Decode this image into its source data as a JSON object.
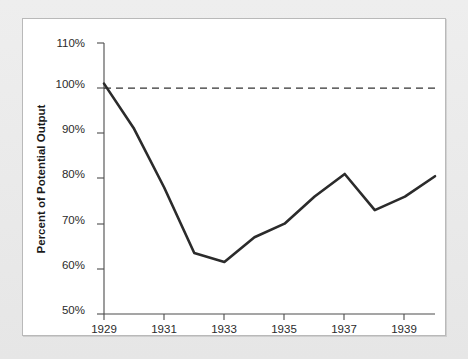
{
  "chart_data": {
    "type": "line",
    "title": "",
    "xlabel": "",
    "ylabel": "Percent of Potential Output",
    "x": [
      1929,
      1930,
      1931,
      1932,
      1933,
      1934,
      1935,
      1936,
      1937,
      1938,
      1939,
      1940
    ],
    "values": [
      101,
      91,
      78,
      63.5,
      61.5,
      67,
      70,
      76,
      81,
      73,
      76,
      80.5
    ],
    "series": [
      {
        "name": "Actual output as percent of potential",
        "values": [
          101,
          91,
          78,
          63.5,
          61.5,
          67,
          70,
          76,
          81,
          73,
          76,
          80.5
        ]
      }
    ],
    "xlim": [
      1929,
      1940
    ],
    "ylim": [
      50,
      110
    ],
    "grid": false,
    "legend": "none",
    "y_ticks": [
      50,
      60,
      70,
      80,
      90,
      100,
      110
    ],
    "y_tick_labels": [
      "50%",
      "60%",
      "70%",
      "80%",
      "90%",
      "100%",
      "110%"
    ],
    "x_ticks": [
      1929,
      1930,
      1931,
      1932,
      1933,
      1934,
      1935,
      1936,
      1937,
      1938,
      1939,
      1940
    ],
    "x_tick_labels": [
      "1929",
      "",
      "1931",
      "",
      "1933",
      "",
      "1935",
      "",
      "1937",
      "",
      "1939",
      ""
    ],
    "x_labeled_ticks": [
      {
        "value": 1929,
        "label": "1929"
      },
      {
        "value": 1931,
        "label": "1931"
      },
      {
        "value": 1933,
        "label": "1933"
      },
      {
        "value": 1935,
        "label": "1935"
      },
      {
        "value": 1937,
        "label": "1937"
      },
      {
        "value": 1939,
        "label": "1939"
      }
    ],
    "reference_lines": [
      {
        "name": "potential-output-line",
        "y": 100,
        "style": "dashed",
        "label": ""
      }
    ]
  },
  "colors": {
    "data_line": "#2b2b2b",
    "axis": "#4c4c4c",
    "reference_line": "#333333",
    "plot_background": "#ffffff",
    "frame_background": "#e9e9e9",
    "text": "#1a1a1a"
  }
}
